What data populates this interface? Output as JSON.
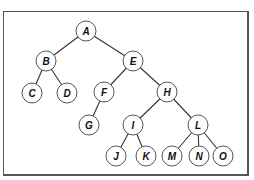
{
  "diagram": {
    "type": "binary-tree",
    "style": {
      "frame_color": "#555555",
      "edge_color": "#333333",
      "node_stroke": "#555555",
      "node_fill": "#ffffff",
      "label_color": "#111111",
      "node_radius": 10
    },
    "nodes": [
      {
        "id": "A",
        "label": "A",
        "x": 86,
        "y": 31
      },
      {
        "id": "B",
        "label": "B",
        "x": 46,
        "y": 61
      },
      {
        "id": "E",
        "label": "E",
        "x": 133,
        "y": 61
      },
      {
        "id": "C",
        "label": "C",
        "x": 32,
        "y": 93
      },
      {
        "id": "D",
        "label": "D",
        "x": 67,
        "y": 93
      },
      {
        "id": "F",
        "label": "F",
        "x": 104,
        "y": 92
      },
      {
        "id": "H",
        "label": "H",
        "x": 167,
        "y": 92
      },
      {
        "id": "G",
        "label": "G",
        "x": 89,
        "y": 125
      },
      {
        "id": "I",
        "label": "I",
        "x": 133,
        "y": 125
      },
      {
        "id": "L",
        "label": "L",
        "x": 198,
        "y": 125
      },
      {
        "id": "J",
        "label": "J",
        "x": 116,
        "y": 156
      },
      {
        "id": "K",
        "label": "K",
        "x": 146,
        "y": 156
      },
      {
        "id": "M",
        "label": "M",
        "x": 172,
        "y": 156
      },
      {
        "id": "N",
        "label": "N",
        "x": 199,
        "y": 156
      },
      {
        "id": "O",
        "label": "O",
        "x": 223,
        "y": 156
      }
    ],
    "edges": [
      {
        "from": "A",
        "to": "B"
      },
      {
        "from": "A",
        "to": "E"
      },
      {
        "from": "B",
        "to": "C"
      },
      {
        "from": "B",
        "to": "D"
      },
      {
        "from": "E",
        "to": "F"
      },
      {
        "from": "E",
        "to": "H"
      },
      {
        "from": "F",
        "to": "G"
      },
      {
        "from": "H",
        "to": "I"
      },
      {
        "from": "H",
        "to": "L"
      },
      {
        "from": "I",
        "to": "J"
      },
      {
        "from": "I",
        "to": "K"
      },
      {
        "from": "L",
        "to": "M"
      },
      {
        "from": "L",
        "to": "N"
      },
      {
        "from": "L",
        "to": "O"
      }
    ]
  }
}
